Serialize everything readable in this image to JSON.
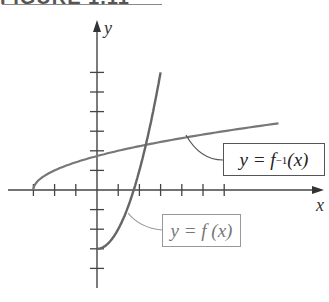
{
  "header": {
    "text": "FIGURE 1.11"
  },
  "diagram": {
    "axes": {
      "x_label": "x",
      "y_label": "y"
    },
    "labels": {
      "inverse": {
        "prefix": "y = f",
        "sup": "−1",
        "suffix": " (x)"
      },
      "function": {
        "text": "y = f (x)"
      }
    },
    "colors": {
      "axis": "#444444",
      "f_curve": "#666666",
      "inverse_curve": "#777777",
      "f_label_border": "#999999",
      "inverse_label_border": "#555555"
    }
  },
  "chart_data": {
    "type": "line",
    "title": "",
    "xlabel": "x",
    "ylabel": "y",
    "xlim": [
      -3.2,
      6.5
    ],
    "ylim": [
      -4.7,
      7.6
    ],
    "grid": false,
    "x_ticks": [
      -3,
      -2,
      -1,
      1,
      2,
      3,
      4,
      5,
      6
    ],
    "y_ticks": [
      -4,
      -3,
      -2,
      -1,
      1,
      2,
      3,
      4,
      5,
      6
    ],
    "series": [
      {
        "name": "y = f(x)",
        "x": [
          0,
          0.5,
          1,
          1.5,
          2,
          2.5,
          3
        ],
        "y": [
          -3,
          -2.75,
          -2,
          -0.75,
          1,
          3.25,
          6
        ]
      },
      {
        "name": "y = f^-1(x)",
        "x": [
          -3,
          -2.75,
          -2,
          -0.75,
          1,
          3.25,
          6
        ],
        "y": [
          0,
          0.5,
          1,
          1.5,
          2,
          2.5,
          3
        ]
      }
    ]
  }
}
